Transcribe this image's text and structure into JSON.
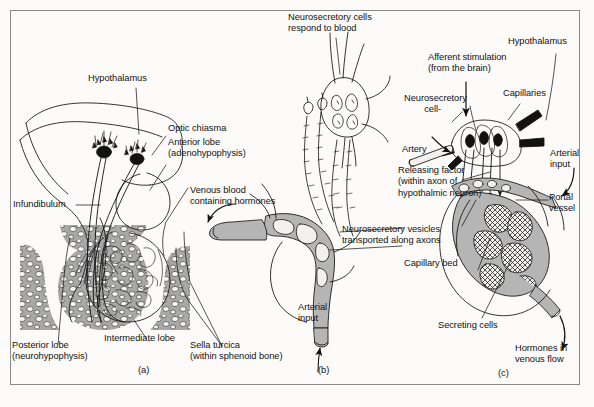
{
  "figure": {
    "background_color": "#fcfbf9",
    "frame_color": "#8a8a8a",
    "ink_color": "#121212",
    "bone_fill": "#a8a8a8",
    "vessel_fill": "#b5b5b5",
    "panel_ids": [
      {
        "id": "panel-a",
        "label": "(a)",
        "x": 138,
        "y": 369
      },
      {
        "id": "panel-b",
        "label": "(b)",
        "x": 318,
        "y": 369
      },
      {
        "id": "panel-c",
        "label": "(c)",
        "x": 498,
        "y": 372
      }
    ]
  },
  "panel_a": {
    "name": "sagittal-section-pituitary",
    "labels": [
      {
        "key": "hypothalamus",
        "text": "Hypothalamus",
        "x": 88,
        "y": 79
      },
      {
        "key": "optic_chiasma",
        "text": "Optic chiasma",
        "x": 168,
        "y": 129
      },
      {
        "key": "anterior_lobe",
        "text": "Anterior lobe\n(adenohypophysis)",
        "x": 168,
        "y": 143
      },
      {
        "key": "infundibulum",
        "text": "Infundibulum",
        "x": 13,
        "y": 203
      },
      {
        "key": "posterior_lobe",
        "text": "Posterior lobe\n(neurohypophysis)",
        "x": 12,
        "y": 346
      },
      {
        "key": "intermediate_lobe",
        "text": "Intermediate lobe",
        "x": 104,
        "y": 340
      },
      {
        "key": "sella_turcica",
        "text": "Sella turcica\n(within sphenoid bone)",
        "x": 190,
        "y": 346
      }
    ]
  },
  "panel_b": {
    "name": "neurosecretory-cells-posterior-lobe",
    "labels": [
      {
        "key": "neurosecretory_cells_respond",
        "text": "Neurosecretory cells\nrespond to blood",
        "x": 290,
        "y": 16
      },
      {
        "key": "venous_blood",
        "text": "Venous blood\ncontaining hormones",
        "x": 192,
        "y": 191
      },
      {
        "key": "neurosecretory_vesicles",
        "text": "Neurosecretory vesicles\ntransported along axons",
        "x": 344,
        "y": 229
      },
      {
        "key": "arterial_input",
        "text": "Arterial\ninput",
        "x": 300,
        "y": 307
      }
    ]
  },
  "panel_c": {
    "name": "releasing-factor-anterior-lobe",
    "labels": [
      {
        "key": "afferent_stimulation",
        "text": "Afferent stimulation\n(from the brain)",
        "x": 430,
        "y": 58
      },
      {
        "key": "hypothalamus_c",
        "text": "Hypothalamus",
        "x": 512,
        "y": 41
      },
      {
        "key": "neurosecretory_cell",
        "text": "Neurosecretory\n        cell-",
        "x": 406,
        "y": 98
      },
      {
        "key": "capillaries",
        "text": "Capillaries",
        "x": 505,
        "y": 93
      },
      {
        "key": "artery",
        "text": "Artery",
        "x": 403,
        "y": 149
      },
      {
        "key": "arterial_input_c",
        "text": "Arterial\ninput",
        "x": 552,
        "y": 153
      },
      {
        "key": "releasing_factor",
        "text": "Releasing factor\n(within axon of\nhypothalmic neuron)",
        "x": 400,
        "y": 170
      },
      {
        "key": "portal_vessel",
        "text": "Portal\nvessel",
        "x": 551,
        "y": 197
      },
      {
        "key": "capillary_bed",
        "text": "Capillary bed",
        "x": 406,
        "y": 263
      },
      {
        "key": "secreting_cells",
        "text": "Secreting cells",
        "x": 440,
        "y": 325
      },
      {
        "key": "hormones_venous",
        "text": "Hormones in\nvenous flow",
        "x": 517,
        "y": 348
      }
    ]
  }
}
